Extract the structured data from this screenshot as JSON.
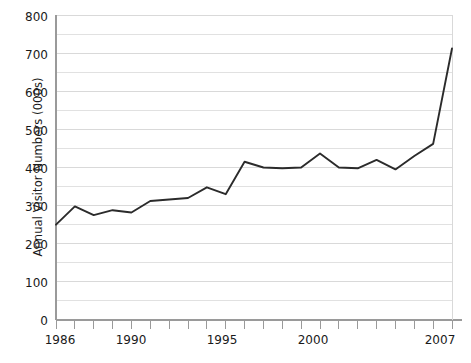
{
  "chart_data": {
    "type": "line",
    "title": "",
    "xlabel": "",
    "ylabel": "Annual Visitor Numbers (000s)",
    "xlim": [
      1986,
      2007
    ],
    "ylim": [
      0,
      800
    ],
    "y_ticks": [
      0,
      100,
      200,
      300,
      400,
      500,
      600,
      700,
      800
    ],
    "y_tick_labels": [
      "0",
      "100",
      "200",
      "300",
      "400",
      "500",
      "600",
      "700",
      "800"
    ],
    "y_minor_gridline_step": 50,
    "x_ticks": [
      1986,
      1987,
      1988,
      1989,
      1990,
      1991,
      1992,
      1993,
      1994,
      1995,
      1996,
      1997,
      1998,
      1999,
      2000,
      2001,
      2002,
      2003,
      2004,
      2005,
      2006,
      2007
    ],
    "x_tick_labels_shown": [
      "1986",
      "1990",
      "1995",
      "2000",
      "2007"
    ],
    "x_tick_labels_shown_values": [
      1986,
      1990,
      1995,
      2000,
      2007
    ],
    "grid": true,
    "legend": "none",
    "line_color": "#2b2b2b",
    "grid_color": "#d9d9d9",
    "axis_color": "#9a9a9a",
    "x": [
      1986,
      1987,
      1988,
      1989,
      1990,
      1991,
      1992,
      1993,
      1994,
      1995,
      1996,
      1997,
      1998,
      1999,
      2000,
      2001,
      2002,
      2003,
      2004,
      2005,
      2006,
      2007
    ],
    "values": [
      250,
      298,
      275,
      288,
      282,
      312,
      316,
      320,
      348,
      330,
      415,
      400,
      398,
      400,
      437,
      400,
      398,
      420,
      395,
      430,
      462,
      712
    ],
    "series": [
      {
        "name": "Annual Visitor Numbers",
        "values": [
          250,
          298,
          275,
          288,
          282,
          312,
          316,
          320,
          348,
          330,
          415,
          400,
          398,
          400,
          437,
          400,
          398,
          420,
          395,
          430,
          462,
          712
        ]
      }
    ]
  },
  "axis": {
    "y_title": "Annual Visitor Numbers (000s)",
    "y_labels": {
      "l800": "800",
      "l700": "700",
      "l600": "600",
      "l500": "500",
      "l400": "400",
      "l300": "300",
      "l200": "200",
      "l100": "100",
      "l0": "0"
    },
    "x_labels": {
      "x1986": "1986",
      "x1990": "1990",
      "x1995": "1995",
      "x2000": "2000",
      "x2007": "2007"
    }
  }
}
